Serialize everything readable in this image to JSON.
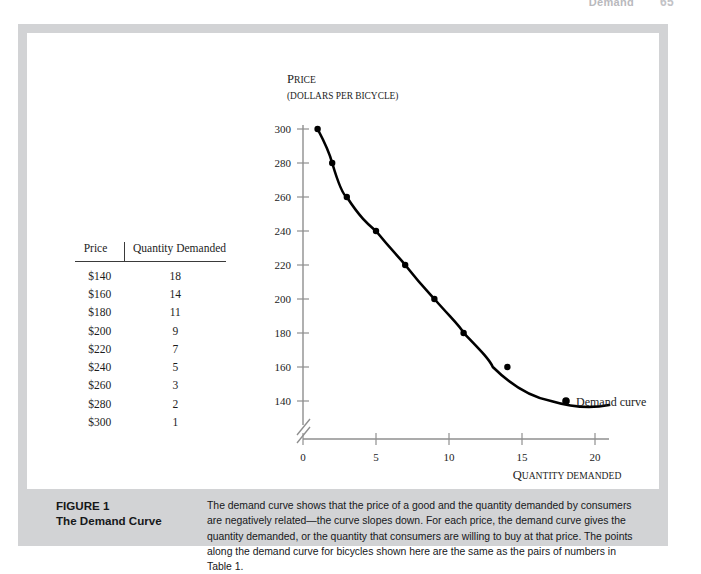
{
  "page_header": {
    "chapter_label": "Demand",
    "page_number": "65"
  },
  "figure": {
    "caption_title_line1": "FIGURE 1",
    "caption_title_line2": "The Demand Curve",
    "caption_body": "The demand curve shows that the price of a good and the quantity demanded by consumers are negatively related—the curve slopes down. For each price, the demand curve gives the quantity demanded, or the quantity that consumers are willing to buy at that price. The points along the demand curve for bicycles shown here are the same as the pairs of numbers in Table 1."
  },
  "table": {
    "headers": [
      "Price",
      "Quantity Demanded"
    ],
    "rows": [
      [
        "$140",
        "18"
      ],
      [
        "$160",
        "14"
      ],
      [
        "$180",
        "11"
      ],
      [
        "$200",
        "9"
      ],
      [
        "$220",
        "7"
      ],
      [
        "$240",
        "5"
      ],
      [
        "$260",
        "3"
      ],
      [
        "$280",
        "2"
      ],
      [
        "$300",
        "1"
      ]
    ]
  },
  "chart_data": {
    "type": "line",
    "title": "",
    "ylabel_main": "Price",
    "ylabel_sub": "(dollars per bicycle)",
    "xlabel_main": "Quantity demanded",
    "xlabel_sub": "(millions of bicycles)",
    "series_label": "Demand curve",
    "x": [
      1,
      2,
      3,
      5,
      7,
      9,
      11,
      14,
      18
    ],
    "y": [
      300,
      280,
      260,
      240,
      220,
      200,
      180,
      160,
      140
    ],
    "xticks": [
      "0",
      "5",
      "10",
      "15",
      "20"
    ],
    "xtick_values": [
      0,
      5,
      10,
      15,
      20
    ],
    "yticks": [
      "140",
      "160",
      "180",
      "200",
      "220",
      "240",
      "260",
      "280",
      "300"
    ],
    "ytick_values": [
      140,
      160,
      180,
      200,
      220,
      240,
      260,
      280,
      300
    ],
    "xlim": [
      0,
      21.5
    ],
    "ylim": [
      140,
      300
    ],
    "grid": false,
    "axis_break": true,
    "legend_position": "inline-right",
    "curve_color": "#000000",
    "axis_color": "#8a8a8a"
  },
  "colors": {
    "frame_gray": "#d2d3d5",
    "panel_white": "#ffffff",
    "text_dark": "#16181a"
  }
}
